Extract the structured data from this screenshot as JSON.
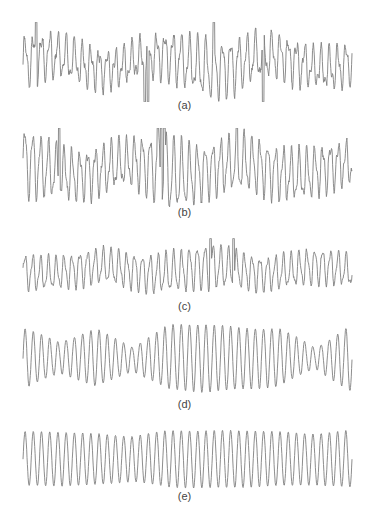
{
  "figure": {
    "stroke_color": "#808080",
    "panels": [
      {
        "id": "a",
        "label": "(a)",
        "top": 22,
        "height": 80,
        "label_top": 99,
        "cycles": 40,
        "irregularity": 0.9,
        "spikes": [
          [
            0.04,
            1
          ],
          [
            0.37,
            -1
          ],
          [
            0.38,
            -1
          ],
          [
            0.58,
            1
          ],
          [
            0.73,
            -1
          ]
        ],
        "envelope": [
          0.55,
          0.5,
          0.45,
          0.4,
          0.55,
          0.7,
          0.6,
          0.5,
          0.45,
          0.5
        ]
      },
      {
        "id": "b",
        "label": "(b)",
        "top": 128,
        "height": 82,
        "label_top": 206,
        "cycles": 42,
        "irregularity": 0.8,
        "spikes": [
          [
            0.11,
            1
          ],
          [
            0.41,
            1
          ],
          [
            0.42,
            1
          ],
          [
            0.43,
            1
          ],
          [
            0.65,
            1
          ]
        ],
        "envelope": [
          0.85,
          0.6,
          0.55,
          0.55,
          0.9,
          0.6,
          0.65,
          0.6,
          0.55,
          0.5
        ]
      },
      {
        "id": "c",
        "label": "(c)",
        "top": 238,
        "height": 64,
        "label_top": 300,
        "cycles": 42,
        "irregularity": 0.6,
        "spikes": [
          [
            0.57,
            1
          ],
          [
            0.64,
            1
          ]
        ],
        "envelope": [
          0.55,
          0.5,
          0.55,
          0.55,
          0.6,
          0.7,
          0.55,
          0.5,
          0.55,
          0.5
        ]
      },
      {
        "id": "d",
        "label": "(d)",
        "top": 322,
        "height": 72,
        "label_top": 398,
        "cycles": 40,
        "irregularity": 0.1,
        "spikes": [],
        "envelope": [
          0.9,
          0.45,
          0.85,
          0.35,
          0.95,
          1.0,
          0.9,
          0.85,
          0.3,
          1.0
        ]
      },
      {
        "id": "e",
        "label": "(e)",
        "top": 427,
        "height": 64,
        "label_top": 490,
        "cycles": 40,
        "irregularity": 0.05,
        "spikes": [],
        "envelope": [
          0.9,
          0.9,
          0.85,
          0.75,
          0.95,
          0.95,
          0.95,
          0.9,
          0.85,
          0.95
        ]
      }
    ]
  }
}
